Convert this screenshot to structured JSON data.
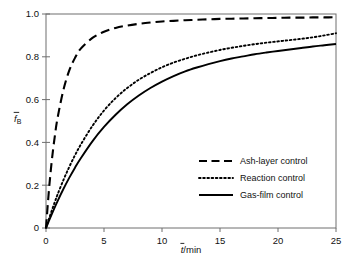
{
  "chart_data": {
    "type": "line",
    "title": "",
    "subtitle": "",
    "xlabel": "t/min",
    "xlabel_parts": {
      "symbol": "t",
      "overbar": true,
      "suffix": "/min"
    },
    "ylabel": "fB",
    "ylabel_parts": {
      "symbol": "f",
      "overbar": true,
      "subscript": "B"
    },
    "xlim": [
      0,
      25
    ],
    "ylim": [
      0,
      1.0
    ],
    "xticks": [
      0,
      5,
      10,
      15,
      20,
      25
    ],
    "xtick_labels": [
      "0",
      "5",
      "10",
      "15",
      "20",
      "25"
    ],
    "yticks": [
      0,
      0.2,
      0.4,
      0.6,
      0.8,
      1.0
    ],
    "ytick_labels": [
      "0",
      "0.2",
      "0.4",
      "0.6",
      "0.8",
      "1.0"
    ],
    "grid": false,
    "legend_position": "center-right",
    "x": [
      0,
      0.25,
      0.5,
      0.75,
      1,
      1.5,
      2,
      2.5,
      3,
      4,
      5,
      6,
      7,
      8,
      9,
      10,
      11,
      12,
      13,
      14,
      15,
      16,
      17,
      18,
      19,
      20,
      21,
      22,
      23,
      24,
      25
    ],
    "series": [
      {
        "name": "Ash-layer control",
        "style": "dashed",
        "color": "#000000",
        "values": [
          0,
          0.175,
          0.315,
          0.425,
          0.515,
          0.645,
          0.735,
          0.795,
          0.838,
          0.888,
          0.917,
          0.935,
          0.946,
          0.954,
          0.96,
          0.965,
          0.968,
          0.971,
          0.973,
          0.975,
          0.977,
          0.978,
          0.979,
          0.98,
          0.981,
          0.982,
          0.983,
          0.983,
          0.984,
          0.984,
          0.985
        ]
      },
      {
        "name": "Reaction control",
        "style": "dotted",
        "color": "#000000",
        "values": [
          0,
          0.042,
          0.082,
          0.12,
          0.157,
          0.224,
          0.285,
          0.34,
          0.39,
          0.477,
          0.549,
          0.607,
          0.654,
          0.693,
          0.724,
          0.751,
          0.773,
          0.791,
          0.807,
          0.82,
          0.832,
          0.842,
          0.851,
          0.859,
          0.866,
          0.872,
          0.878,
          0.884,
          0.891,
          0.9,
          0.91
        ]
      },
      {
        "name": "Gas-film control",
        "style": "solid",
        "color": "#000000",
        "values": [
          0,
          0.033,
          0.065,
          0.096,
          0.126,
          0.182,
          0.234,
          0.282,
          0.326,
          0.405,
          0.472,
          0.529,
          0.578,
          0.619,
          0.654,
          0.684,
          0.71,
          0.732,
          0.75,
          0.766,
          0.78,
          0.792,
          0.802,
          0.812,
          0.82,
          0.827,
          0.834,
          0.841,
          0.848,
          0.854,
          0.86
        ]
      }
    ],
    "legend_entries": [
      {
        "label": "Ash-layer control",
        "style": "dashed"
      },
      {
        "label": "Reaction control",
        "style": "dotted"
      },
      {
        "label": "Gas-film control",
        "style": "solid"
      }
    ]
  },
  "colors": {
    "axis": "#6e6e6e",
    "curve": "#000000",
    "text": "#111111",
    "background": "#ffffff"
  }
}
